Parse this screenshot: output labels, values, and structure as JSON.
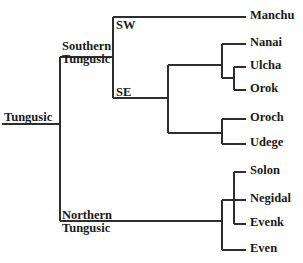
{
  "figure": {
    "type": "cladogram",
    "line_color": "#2e2e2e",
    "text_color": "#1a1a1a",
    "background": "#ffffff"
  },
  "root": {
    "label": "Tungusic",
    "x": 60,
    "y": 124,
    "label_x": 4,
    "label_y": 111,
    "stem_start_x": 2
  },
  "clades": [
    {
      "id": "southern",
      "label_line1": "Southern",
      "label_line2": "Tungusic",
      "label_x": 62,
      "label_y": 40,
      "node_x": 113,
      "node_y": 57
    },
    {
      "id": "northern",
      "label_line1": "Northern",
      "label_line2": "Tungusic",
      "label_x": 62,
      "label_y": 209,
      "node_x": 222,
      "node_y": 221
    }
  ],
  "internal_labels": [
    {
      "id": "sw",
      "text": "SW",
      "x": 116,
      "y": 19
    },
    {
      "id": "se",
      "text": "SE",
      "x": 116,
      "y": 86
    }
  ],
  "leaves": [
    {
      "id": "manchu",
      "label": "Manchu",
      "y": 17,
      "branch_from_x": 113,
      "branch_to_x": 246,
      "label_x": 250,
      "label_y": 9
    },
    {
      "id": "nanai",
      "label": "Nanai",
      "y": 44,
      "branch_from_x": 222,
      "branch_to_x": 246,
      "label_x": 250,
      "label_y": 36
    },
    {
      "id": "ulcha",
      "label": "Ulcha",
      "y": 67,
      "branch_from_x": 234,
      "branch_to_x": 246,
      "label_x": 250,
      "label_y": 59
    },
    {
      "id": "orok",
      "label": "Orok",
      "y": 90,
      "branch_from_x": 234,
      "branch_to_x": 246,
      "label_x": 250,
      "label_y": 82
    },
    {
      "id": "oroch",
      "label": "Oroch",
      "y": 119,
      "branch_from_x": 222,
      "branch_to_x": 246,
      "label_x": 250,
      "label_y": 111
    },
    {
      "id": "udege",
      "label": "Udege",
      "y": 144,
      "branch_from_x": 222,
      "branch_to_x": 246,
      "label_x": 250,
      "label_y": 136
    },
    {
      "id": "solon",
      "label": "Solon",
      "y": 172,
      "branch_from_x": 234,
      "branch_to_x": 246,
      "label_x": 250,
      "label_y": 164
    },
    {
      "id": "negidal",
      "label": "Negidal",
      "y": 200,
      "branch_from_x": 234,
      "branch_to_x": 246,
      "label_x": 250,
      "label_y": 192
    },
    {
      "id": "evenk",
      "label": "Evenk",
      "y": 224,
      "branch_from_x": 234,
      "branch_to_x": 246,
      "label_x": 250,
      "label_y": 216
    },
    {
      "id": "even",
      "label": "Even",
      "y": 250,
      "branch_from_x": 222,
      "branch_to_x": 246,
      "label_x": 250,
      "label_y": 242
    }
  ],
  "chart_data": {
    "type": "tree",
    "title": "Tungusic",
    "structure": {
      "name": "Tungusic",
      "children": [
        {
          "name": "Southern Tungusic",
          "children": [
            {
              "name": "SW",
              "children": [
                {
                  "name": "Manchu"
                }
              ]
            },
            {
              "name": "SE",
              "children": [
                {
                  "name": "",
                  "children": [
                    {
                      "name": "Nanai"
                    },
                    {
                      "name": "",
                      "children": [
                        {
                          "name": "Ulcha"
                        },
                        {
                          "name": "Orok"
                        }
                      ]
                    }
                  ]
                },
                {
                  "name": "",
                  "children": [
                    {
                      "name": "Oroch"
                    },
                    {
                      "name": "Udege"
                    }
                  ]
                }
              ]
            }
          ]
        },
        {
          "name": "Northern Tungusic",
          "children": [
            {
              "name": "",
              "children": [
                {
                  "name": "Solon"
                },
                {
                  "name": "Negidal"
                },
                {
                  "name": "Evenk"
                }
              ]
            },
            {
              "name": "Even"
            }
          ]
        }
      ]
    },
    "leaf_order": [
      "Manchu",
      "Nanai",
      "Ulcha",
      "Orok",
      "Oroch",
      "Udege",
      "Solon",
      "Negidal",
      "Evenk",
      "Even"
    ]
  },
  "edges": [
    {
      "id": "root-stem",
      "x1": 2,
      "y1": 124,
      "x2": 60,
      "y2": 124
    },
    {
      "id": "root-vertical",
      "x1": 60,
      "y1": 57,
      "x2": 60,
      "y2": 221
    },
    {
      "id": "southern-branch",
      "x1": 60,
      "y1": 57,
      "x2": 113,
      "y2": 57
    },
    {
      "id": "southern-vertical",
      "x1": 113,
      "y1": 17,
      "x2": 113,
      "y2": 98
    },
    {
      "id": "sw-manchu",
      "x1": 113,
      "y1": 17,
      "x2": 246,
      "y2": 17
    },
    {
      "id": "se-branch",
      "x1": 113,
      "y1": 98,
      "x2": 168,
      "y2": 98
    },
    {
      "id": "se-vertical",
      "x1": 168,
      "y1": 65,
      "x2": 168,
      "y2": 133
    },
    {
      "id": "nanai-group-branch",
      "x1": 168,
      "y1": 65,
      "x2": 222,
      "y2": 65
    },
    {
      "id": "nanai-group-vertical",
      "x1": 222,
      "y1": 44,
      "x2": 222,
      "y2": 78
    },
    {
      "id": "nanai-leaf",
      "x1": 222,
      "y1": 44,
      "x2": 246,
      "y2": 44
    },
    {
      "id": "ulcha-orok-branch",
      "x1": 222,
      "y1": 78,
      "x2": 234,
      "y2": 78
    },
    {
      "id": "ulcha-orok-vertical",
      "x1": 234,
      "y1": 67,
      "x2": 234,
      "y2": 90
    },
    {
      "id": "ulcha-leaf",
      "x1": 234,
      "y1": 67,
      "x2": 246,
      "y2": 67
    },
    {
      "id": "orok-leaf",
      "x1": 234,
      "y1": 90,
      "x2": 246,
      "y2": 90
    },
    {
      "id": "oroch-udege-branch",
      "x1": 168,
      "y1": 133,
      "x2": 222,
      "y2": 133
    },
    {
      "id": "oroch-udege-vertical",
      "x1": 222,
      "y1": 119,
      "x2": 222,
      "y2": 144
    },
    {
      "id": "oroch-leaf",
      "x1": 222,
      "y1": 119,
      "x2": 246,
      "y2": 119
    },
    {
      "id": "udege-leaf",
      "x1": 222,
      "y1": 144,
      "x2": 246,
      "y2": 144
    },
    {
      "id": "northern-branch",
      "x1": 60,
      "y1": 221,
      "x2": 222,
      "y2": 221
    },
    {
      "id": "northern-vertical",
      "x1": 222,
      "y1": 200,
      "x2": 222,
      "y2": 250
    },
    {
      "id": "even-leaf",
      "x1": 222,
      "y1": 250,
      "x2": 246,
      "y2": 250
    },
    {
      "id": "solon-group-branch",
      "x1": 222,
      "y1": 200,
      "x2": 234,
      "y2": 200
    },
    {
      "id": "solon-group-vertical",
      "x1": 234,
      "y1": 172,
      "x2": 234,
      "y2": 224
    },
    {
      "id": "solon-leaf",
      "x1": 234,
      "y1": 172,
      "x2": 246,
      "y2": 172
    },
    {
      "id": "negidal-leaf",
      "x1": 234,
      "y1": 200,
      "x2": 246,
      "y2": 200
    },
    {
      "id": "evenk-leaf",
      "x1": 234,
      "y1": 224,
      "x2": 246,
      "y2": 224
    }
  ]
}
